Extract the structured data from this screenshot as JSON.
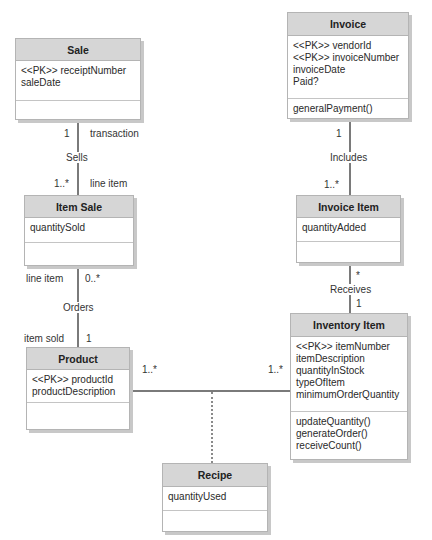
{
  "classes": {
    "sale": {
      "name": "Sale",
      "attributes": [
        "<<PK>> receiptNumber",
        "saleDate"
      ],
      "methods": []
    },
    "invoice": {
      "name": "Invoice",
      "attributes": [
        "<<PK>> vendorId",
        "<<PK>> invoiceNumber",
        "invoiceDate",
        "Paid?"
      ],
      "methods": [
        "generalPayment()"
      ]
    },
    "item_sale": {
      "name": "Item Sale",
      "attributes": [
        "quantitySold"
      ],
      "methods": []
    },
    "invoice_item": {
      "name": "Invoice Item",
      "attributes": [
        "quantityAdded"
      ],
      "methods": []
    },
    "product": {
      "name": "Product",
      "attributes": [
        "<<PK>> productId",
        "productDescription"
      ],
      "methods": []
    },
    "inventory_item": {
      "name": "Inventory Item",
      "attributes": [
        "<<PK>> itemNumber",
        "itemDescription",
        "quantityInStock",
        "typeOfItem",
        "minimumOrderQuantity"
      ],
      "methods": [
        "updateQuantity()",
        "generateOrder()",
        "receiveCount()"
      ]
    },
    "recipe": {
      "name": "Recipe",
      "attributes": [
        "quantityUsed"
      ],
      "methods": []
    }
  },
  "associations": {
    "sells": {
      "name": "Sells",
      "top_mult": "1",
      "top_role": "transaction",
      "bottom_mult": "1..*",
      "bottom_role": "line item"
    },
    "orders": {
      "name": "Orders",
      "top_mult": "0..*",
      "top_role": "line item",
      "bottom_mult": "1",
      "bottom_role": "item sold"
    },
    "includes": {
      "name": "Includes",
      "top_mult": "1",
      "bottom_mult": "1..*"
    },
    "receives": {
      "name": "Receives",
      "top_mult": "*",
      "bottom_mult": "1"
    },
    "product_inventory": {
      "left_mult": "1..*",
      "right_mult": "1..*",
      "association_class": "Recipe"
    }
  },
  "colors": {
    "header_bg": "#d6d6d6",
    "border": "#b4b4b4",
    "line": "#7a7a7a"
  }
}
